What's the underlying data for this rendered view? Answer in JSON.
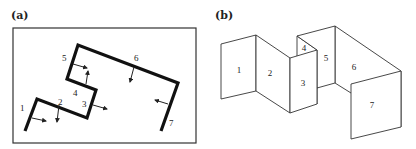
{
  "panel_a": {
    "label": "(a)",
    "description": "Top-down floor plan: thick polyline of 7 wall segments inside a rectangular frame, with normal arrows",
    "segments": [
      {
        "id": "1",
        "label": "1"
      },
      {
        "id": "2",
        "label": "2"
      },
      {
        "id": "3",
        "label": "3"
      },
      {
        "id": "4",
        "label": "4"
      },
      {
        "id": "5",
        "label": "5"
      },
      {
        "id": "6",
        "label": "6"
      },
      {
        "id": "7",
        "label": "7"
      }
    ]
  },
  "panel_b": {
    "label": "(b)",
    "description": "3D isometric rendering of the 7 vertical wall panels",
    "faces": [
      {
        "id": "1",
        "label": "1"
      },
      {
        "id": "2",
        "label": "2"
      },
      {
        "id": "3",
        "label": "3"
      },
      {
        "id": "4",
        "label": "4"
      },
      {
        "id": "5",
        "label": "5"
      },
      {
        "id": "6",
        "label": "6"
      },
      {
        "id": "7",
        "label": "7"
      }
    ]
  },
  "colors": {
    "line": "#111111",
    "background": "#ffffff"
  }
}
